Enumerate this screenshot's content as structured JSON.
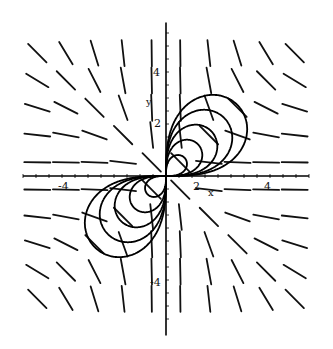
{
  "chart_data": {
    "type": "line",
    "title": "",
    "xlabel": "x",
    "ylabel": "y",
    "xlim": [
      -5.5,
      5.5
    ],
    "ylim": [
      -5.9,
      5.9
    ],
    "x_ticks": [
      -4,
      2,
      4
    ],
    "x_tick_labels": [
      "-4",
      "2",
      "4"
    ],
    "y_ticks": [
      4,
      2,
      -4
    ],
    "y_tick_labels": [
      "4",
      "2",
      "-4"
    ],
    "grid": false,
    "legend": null,
    "direction_field": {
      "description": "Slope field with short line segments; slopes near zero along x-axis, steep near y-axis, negative in quadrants II and IV",
      "grid_x": [
        -4.5,
        -3.5,
        -2.5,
        -1.5,
        -0.5,
        0.5,
        1.5,
        2.5,
        3.5,
        4.5
      ],
      "grid_y": [
        4.5,
        3.5,
        2.5,
        1.5,
        0.5,
        -0.5,
        -1.5,
        -2.5,
        -3.5,
        -4.5
      ]
    },
    "series": [
      {
        "name": "solution curve c=2",
        "family": "lemniscate-loop",
        "c": 2
      },
      {
        "name": "solution curve c=6",
        "family": "lemniscate-loop",
        "c": 6
      },
      {
        "name": "solution curve c=12",
        "family": "lemniscate-loop",
        "c": 12
      },
      {
        "name": "solution curve c=20",
        "family": "lemniscate-loop",
        "c": 20
      },
      {
        "name": "solution curve c=30",
        "family": "lemniscate-loop",
        "c": 30
      }
    ]
  },
  "labels": {
    "x_axis": "x",
    "y_axis": "y",
    "x_tick_neg4": "-4",
    "x_tick_2": "2",
    "x_tick_4": "4",
    "y_tick_4": "4",
    "y_tick_2": "2",
    "y_tick_neg4": "-4"
  }
}
